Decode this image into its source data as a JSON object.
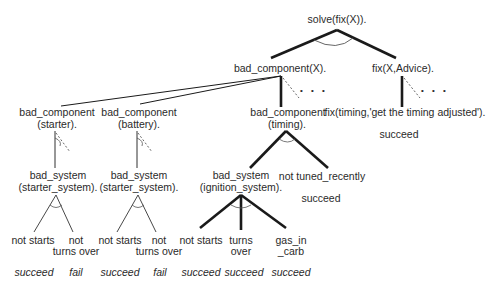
{
  "diagram": {
    "type": "and-or proof tree",
    "root": "solve(fix(X)).",
    "nodes": {
      "bad_component_x": "bad_component(X).",
      "fix_x_advice": "fix(X,Advice).",
      "bc_starter_1": "bad_component",
      "bc_starter_2": "(starter).",
      "bc_battery_1": "bad_component",
      "bc_battery_2": "(battery).",
      "bc_timing_1": "bad_component",
      "bc_timing_2": "(timing).",
      "fix_timing": "fix(timing,'get the timing adjusted').",
      "bs_starter_a_1": "bad_system",
      "bs_starter_a_2": "(starter_system).",
      "bs_starter_b_1": "bad_system",
      "bs_starter_b_2": "(starter_system).",
      "bs_ignition_1": "bad_system",
      "bs_ignition_2": "(ignition_system).",
      "not_tuned_recently": "not tuned_recently",
      "leaf_a1": "not starts",
      "leaf_a2_1": "not",
      "leaf_a2_2": "turns over",
      "leaf_b1": "not starts",
      "leaf_b2_1": "not",
      "leaf_b2_2": "turns over",
      "leaf_c1": "not starts",
      "leaf_c2_1": "turns",
      "leaf_c2_2": "over",
      "leaf_c3_1": "gas_in",
      "leaf_c3_2": "_carb"
    },
    "results": {
      "fix_timing": "succeed",
      "not_tuned_recently": "succeed",
      "a1": "succeed",
      "a2": "fail",
      "b1": "succeed",
      "b2": "fail",
      "c1": "succeed",
      "c2": "succeed",
      "c3": "succeed"
    },
    "ellipsis": "• • •",
    "colors": {
      "line": "#1a1a1a",
      "text": "#2a2a2a",
      "background": "#ffffff"
    }
  }
}
